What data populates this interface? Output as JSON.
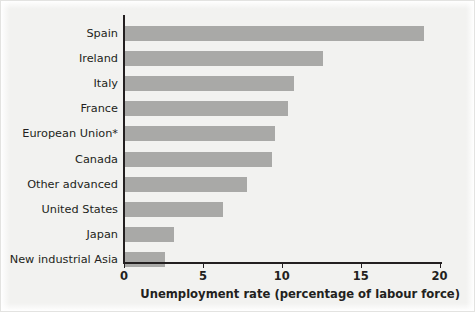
{
  "chart_data": {
    "type": "bar",
    "orientation": "horizontal",
    "title": "",
    "xlabel": "Unemployment rate (percentage of labour force)",
    "ylabel": "",
    "xlim": [
      0,
      21.5
    ],
    "xticks": [
      0,
      5,
      10,
      15,
      20
    ],
    "xtick_labels": [
      "0",
      "5",
      "10",
      "15",
      "20"
    ],
    "grid": false,
    "legend": null,
    "bar_color": "#a9a9a7",
    "axis_color": "#231f20",
    "background_color": "#f2f2f0",
    "categories": [
      "Spain",
      "Ireland",
      "Italy",
      "France",
      "European Union*",
      "Canada",
      "Other advanced",
      "United States",
      "Japan",
      "New industrial Asia"
    ],
    "values": [
      19.0,
      12.6,
      10.8,
      10.4,
      9.6,
      9.4,
      7.8,
      6.3,
      3.2,
      2.6
    ]
  }
}
